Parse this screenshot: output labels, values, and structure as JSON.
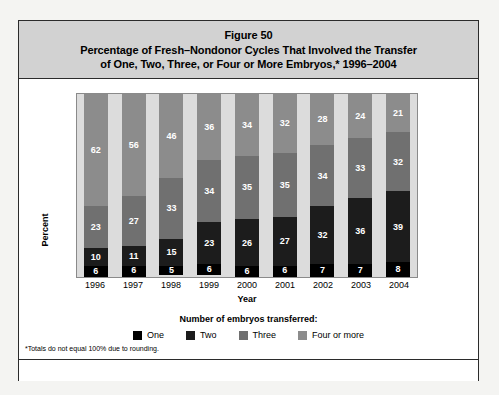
{
  "figure": {
    "number_label": "Figure 50",
    "title_line_1": "Percentage of Fresh–Nondonor Cycles That Involved the Transfer",
    "title_line_2": "of One, Two, Three, or Four or More Embryos,* 1996–2004"
  },
  "legend": {
    "title": "Number of embryos transferred:",
    "items": [
      {
        "label": "One",
        "color": "#000000"
      },
      {
        "label": "Two",
        "color": "#1c1c1c"
      },
      {
        "label": "Three",
        "color": "#707070"
      },
      {
        "label": "Four or more",
        "color": "#8c8c8c"
      }
    ]
  },
  "footnote": "*Totals do not equal 100% due to rounding.",
  "chart_data": {
    "type": "bar",
    "stacked": true,
    "title": "Percentage of Fresh–Nondonor Cycles That Involved the Transfer of One, Two, Three, or Four or More Embryos,* 1996–2004",
    "xlabel": "Year",
    "ylabel": "Percent",
    "ylim": [
      0,
      100
    ],
    "grid": false,
    "legend_position": "bottom",
    "categories": [
      "1996",
      "1997",
      "1998",
      "1999",
      "2000",
      "2001",
      "2002",
      "2003",
      "2004"
    ],
    "series": [
      {
        "name": "One",
        "color": "#000000",
        "values": [
          6,
          6,
          5,
          6,
          6,
          6,
          7,
          7,
          8
        ]
      },
      {
        "name": "Two",
        "color": "#1c1c1c",
        "values": [
          10,
          11,
          15,
          23,
          26,
          27,
          32,
          36,
          39
        ]
      },
      {
        "name": "Three",
        "color": "#707070",
        "values": [
          23,
          27,
          33,
          34,
          35,
          35,
          34,
          33,
          32
        ]
      },
      {
        "name": "Four or more",
        "color": "#8c8c8c",
        "values": [
          62,
          56,
          46,
          36,
          34,
          32,
          28,
          24,
          21
        ]
      }
    ]
  }
}
